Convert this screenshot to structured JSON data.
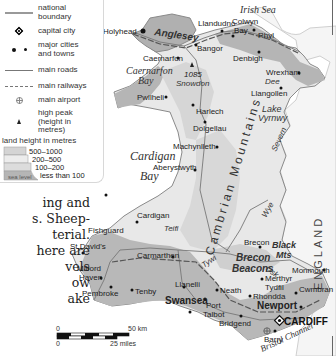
{
  "legend": {
    "items": [
      {
        "symbol": "national-boundary",
        "label_1": "national",
        "label_2": "boundary"
      },
      {
        "symbol": "capital-city",
        "label_1": "capital city"
      },
      {
        "symbol": "major-cities",
        "label_1": "major cities",
        "label_2": "and towns"
      },
      {
        "symbol": "main-roads",
        "label_1": "main roads"
      },
      {
        "symbol": "main-railways",
        "label_1": "main railways"
      },
      {
        "symbol": "main-airport",
        "label_1": "main airport"
      },
      {
        "symbol": "high-peak",
        "label_1": "high peak",
        "label_2": "(height in",
        "label_3": "metres)"
      }
    ],
    "land_height_title": "land height in metres",
    "bands": [
      {
        "label": "500–1000",
        "color": "#cfcfcf"
      },
      {
        "label": "200–500",
        "color": "#e6e6e6"
      },
      {
        "label": "100–200",
        "color": "#d9d9d9"
      },
      {
        "label": "less than 100",
        "color": "#b5b5b5"
      }
    ],
    "sea_level": "sea level"
  },
  "body_text": [
    "ing and",
    "s. Sheep-",
    "terial.",
    "here are",
    "vels",
    "ow",
    "ake"
  ],
  "map": {
    "seas": {
      "irish_sea": "Irish Sea",
      "caernarfon_bay_1": "Caernarfon",
      "caernarfon_bay_2": "Bay",
      "cardigan_bay_1": "Cardigan",
      "cardigan_bay_2": "Bay",
      "bristol_channel": "Bristol Channel"
    },
    "regions": {
      "anglesey": "Anglesey",
      "cambrian_mountains": "Cambrian Mountains",
      "brecon_beacons_1": "Brecon",
      "brecon_beacons_2": "Beacons",
      "black_mts_1": "Black",
      "black_mts_2": "Mts",
      "lake_vyrnwy_1": "Lake",
      "lake_vyrnwy_2": "Vyrnwy",
      "england": "ENGLAND"
    },
    "peak": {
      "height": "1085",
      "name": "Snowdon"
    },
    "rivers": {
      "dee": "Dee",
      "severn": "Severn",
      "wye": "Wye",
      "teifi": "Teifi",
      "tywi": "Tywi",
      "usk": "Usk"
    },
    "capital": "CARDIFF",
    "towns": {
      "holyhead": "Holyhead",
      "llandudno": "Llandudno",
      "colwyn_bay_1": "Colwyn",
      "colwyn_bay_2": "Bay",
      "rhyl": "Rhyl",
      "bangor": "Bangor",
      "caernarfon": "Caernarfon",
      "denbigh": "Denbigh",
      "wrexham": "Wrexham",
      "llangollen": "Llangollen",
      "pwllheli": "Pwllheli",
      "harlech": "Harlech",
      "dolgellau": "Dolgellau",
      "machynlleth": "Machynlleth",
      "aberystwyth": "Aberystwyth",
      "fishguard": "Fishguard",
      "cardigan": "Cardigan",
      "st_davids": "St David's",
      "milford_haven_1": "Milford",
      "milford_haven_2": "Haven",
      "pembroke": "Pembroke",
      "tenby": "Tenby",
      "carmarthen": "Carmarthen",
      "brecon": "Brecon",
      "monmouth": "Monmouth",
      "llanelli": "Llanelli",
      "neath": "Neath",
      "merthyr_1": "Merthyr",
      "merthyr_2": "Tydfil",
      "rhondda": "Rhondda",
      "cwmbran": "Cwmbran",
      "swansea": "Swansea",
      "port_talbot_1": "Port",
      "port_talbot_2": "Talbot",
      "newport": "Newport",
      "bridgend": "Bridgend",
      "barry": "Barry"
    },
    "scale": {
      "zero_top": "0",
      "km": "50 km",
      "zero_bottom": "0",
      "miles": "25 miles"
    }
  },
  "caption": "and the The Welsh"
}
